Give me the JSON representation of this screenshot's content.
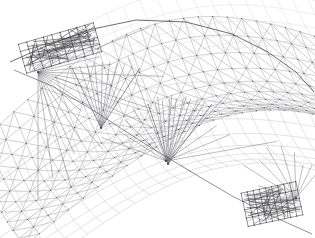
{
  "viewport": {
    "width": 315,
    "height": 238,
    "background_color": "#ffffff",
    "title": "3D Wireframe Mesh"
  },
  "render": {
    "style": "wireframe",
    "shading": "none",
    "line_color_primary": "#9a9a9e",
    "line_color_secondary": "#bcbcc0",
    "line_color_faint": "#d2d2d6",
    "line_color_edge": "#4a4a4e",
    "line_color_edge_dark": "#2f2f33",
    "node_color": "#3a3a3e",
    "antialias": "on"
  },
  "scene": {
    "object_type": "curved-shell-arch-structure",
    "projection": "perspective",
    "view": "three-quarter-oblique",
    "camera_azimuth_deg": 38,
    "camera_elevation_deg": 22
  },
  "mesh": {
    "description": "Quad grid over a doubly-curved arch surface with diagonal bracing",
    "surfaces": [
      {
        "name": "upper-deck-surface",
        "u_divisions": 26,
        "v_divisions": 9,
        "u_start": 0.0,
        "u_end": 1.0,
        "v_start": 0.0,
        "v_end": 1.0,
        "arch_rise": 74,
        "sag": 26,
        "origin_x": -28,
        "origin_y": 150,
        "span_x": 372,
        "span_y": -104,
        "depth_x": 96,
        "depth_y": 96,
        "diagonals": "both",
        "line_class": "grid-line"
      },
      {
        "name": "lower-soffit-surface",
        "u_divisions": 22,
        "v_divisions": 7,
        "arch_rise": 58,
        "sag": 20,
        "origin_x": -22,
        "origin_y": 196,
        "span_x": 340,
        "span_y": -96,
        "depth_x": 84,
        "depth_y": 84,
        "diagonals": "none",
        "line_class": "grid-line-soft"
      },
      {
        "name": "rear-skirt-surface",
        "u_divisions": 18,
        "v_divisions": 5,
        "arch_rise": 40,
        "sag": 12,
        "origin_x": 42,
        "origin_y": 48,
        "span_x": 300,
        "span_y": -40,
        "depth_x": 62,
        "depth_y": 62,
        "diagonals": "none",
        "line_class": "grid-line-faint"
      }
    ],
    "fan_nodes": [
      {
        "name": "fan-node-left",
        "x": 38,
        "y": 72,
        "rays": 16,
        "radius": 130,
        "spread_deg": 120,
        "start_deg": -30
      },
      {
        "name": "fan-node-center",
        "x": 166,
        "y": 161,
        "rays": 13,
        "radius": 118,
        "spread_deg": 150,
        "start_deg": -160
      },
      {
        "name": "fan-node-right",
        "x": 296,
        "y": 198,
        "rays": 11,
        "radius": 72,
        "spread_deg": 140,
        "start_deg": -190
      }
    ],
    "dense_clusters": [
      {
        "name": "cluster-upper-left",
        "x": 60,
        "y": 48,
        "width": 78,
        "height": 30,
        "lines": 72,
        "angle_deg": -16
      },
      {
        "name": "cluster-lower-right",
        "x": 272,
        "y": 204,
        "width": 56,
        "height": 34,
        "lines": 58,
        "angle_deg": -12
      }
    ],
    "cone_features": [
      {
        "name": "cone-left",
        "apex_x": 101,
        "apex_y": 128,
        "base_left_x": 72,
        "base_right_x": 140,
        "base_y": 68
      },
      {
        "name": "cone-right",
        "apex_x": 168,
        "apex_y": 164,
        "base_left_x": 148,
        "base_right_x": 212,
        "base_y": 104
      }
    ],
    "ridge_polyline": [
      [
        10,
        62
      ],
      [
        46,
        46
      ],
      [
        88,
        30
      ],
      [
        136,
        20
      ],
      [
        186,
        22
      ],
      [
        232,
        34
      ],
      [
        268,
        52
      ],
      [
        296,
        72
      ],
      [
        314,
        92
      ]
    ],
    "lower_edge_polyline": [
      [
        14,
        70
      ],
      [
        52,
        86
      ],
      [
        96,
        112
      ],
      [
        142,
        142
      ],
      [
        188,
        170
      ],
      [
        232,
        196
      ],
      [
        272,
        216
      ],
      [
        312,
        234
      ]
    ],
    "node_count": 412,
    "element_count": 968
  }
}
